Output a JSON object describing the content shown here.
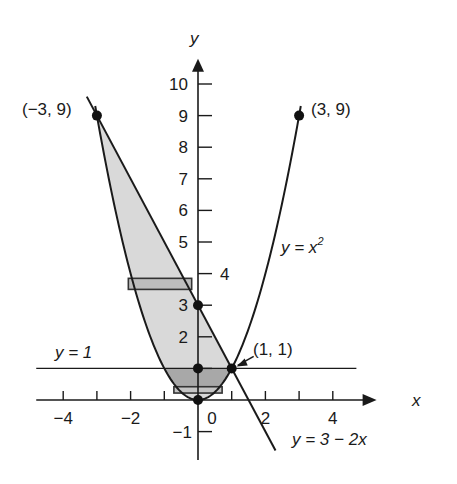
{
  "figure": {
    "type": "region-between-curves",
    "x_axis": {
      "label": "x",
      "range": [
        -4.8,
        5.3
      ],
      "ticks": [
        -4,
        -3,
        -2,
        -1,
        1,
        2,
        3,
        4
      ],
      "tick_labels": [
        {
          "value": -4,
          "text": "−4"
        },
        {
          "value": -2,
          "text": "−2"
        },
        {
          "value": 0,
          "text": "0"
        },
        {
          "value": 2,
          "text": "2"
        },
        {
          "value": 4,
          "text": "4"
        }
      ]
    },
    "y_axis": {
      "label": "y",
      "range": [
        -1.9,
        10.8
      ],
      "ticks": [
        -1,
        1,
        2,
        3,
        4,
        5,
        6,
        7,
        8,
        9,
        10
      ],
      "tick_labels": [
        {
          "value": 10,
          "text": "10"
        },
        {
          "value": 9,
          "text": "9"
        },
        {
          "value": 8,
          "text": "8"
        },
        {
          "value": 7,
          "text": "7"
        },
        {
          "value": 6,
          "text": "6"
        },
        {
          "value": 5,
          "text": "5"
        },
        {
          "value": 4,
          "text": "4"
        },
        {
          "value": 3,
          "text": "3"
        },
        {
          "value": 2,
          "text": "2"
        },
        {
          "value": -1,
          "text": "−1"
        }
      ]
    },
    "curves": [
      {
        "name": "parabola",
        "equation": "y = x^2",
        "label_main": "y = x",
        "label_sup": "2",
        "x_range": [
          -3.05,
          3.05
        ]
      },
      {
        "name": "line",
        "equation": "y = 3 − 2x",
        "label": "y = 3 − 2x",
        "x_range": [
          -3.3,
          2.3
        ]
      },
      {
        "name": "horizontal",
        "equation": "y = 1",
        "label": "y = 1",
        "x_range": [
          -4.8,
          4.7
        ]
      }
    ],
    "points": [
      {
        "x": -3,
        "y": 9,
        "label": "(−3, 9)"
      },
      {
        "x": 3,
        "y": 9,
        "label": "(3, 9)"
      },
      {
        "x": 1,
        "y": 1,
        "label": "(1, 1)"
      },
      {
        "x": 0,
        "y": 3,
        "label": ""
      },
      {
        "x": 0,
        "y": 1,
        "label": ""
      },
      {
        "x": 0,
        "y": 0,
        "label": ""
      }
    ],
    "shaded_region": {
      "description": "Region between y = x^2 and y = 3 − 2x, from x = −3 to x = 1",
      "fill": "#d9d9d9",
      "dark_band": {
        "y_from": 0.4,
        "y_to": 1,
        "fill": "#a8a8a8"
      }
    },
    "strips": [
      {
        "y_from": 3.5,
        "y_to": 3.85,
        "fill": "#bdbdbd"
      },
      {
        "y_from": 0.22,
        "y_to": 0.42,
        "fill": "#c4c4c4"
      }
    ]
  }
}
